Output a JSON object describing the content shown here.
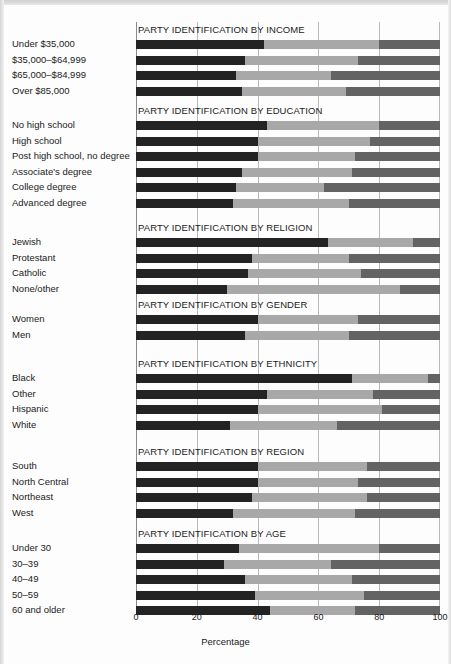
{
  "figure": {
    "xlabel": "Percentage",
    "xticks": [
      "0",
      "20",
      "40",
      "60",
      "80",
      "100"
    ]
  },
  "chart_data": {
    "type": "bar",
    "subtype": "stacked-horizontal-100pct",
    "title": "",
    "xlabel": "Percentage",
    "ylabel": "",
    "xlim": [
      0,
      100
    ],
    "xticks": [
      0,
      20,
      40,
      60,
      80,
      100
    ],
    "grid": true,
    "legend_position": "none",
    "series": [
      {
        "name": "Democrat",
        "color": "#232323"
      },
      {
        "name": "Independent",
        "color": "#a8a8a8"
      },
      {
        "name": "Republican",
        "color": "#636363"
      }
    ],
    "panels": [
      {
        "title": "PARTY IDENTIFICATION BY INCOME",
        "categories": [
          "Under $35,000",
          "$35,000–$64,999",
          "$65,000–$84,999",
          "Over $85,000"
        ],
        "values": [
          [
            42,
            38,
            20
          ],
          [
            36,
            37,
            27
          ],
          [
            33,
            31,
            36
          ],
          [
            35,
            34,
            31
          ]
        ]
      },
      {
        "title": "PARTY IDENTIFICATION BY EDUCATION",
        "categories": [
          "No high school",
          "High school",
          "Post high school, no degree",
          "Associate's degree",
          "College degree",
          "Advanced degree"
        ],
        "values": [
          [
            43,
            37,
            20
          ],
          [
            40,
            37,
            23
          ],
          [
            40,
            32,
            28
          ],
          [
            35,
            36,
            29
          ],
          [
            33,
            29,
            38
          ],
          [
            32,
            38,
            30
          ]
        ]
      },
      {
        "title": "PARTY IDENTIFICATION BY RELIGION",
        "categories": [
          "Jewish",
          "Protestant",
          "Catholic",
          "None/other"
        ],
        "values": [
          [
            63,
            28,
            9
          ],
          [
            38,
            32,
            30
          ],
          [
            37,
            37,
            26
          ],
          [
            30,
            57,
            13
          ]
        ]
      },
      {
        "title": "PARTY IDENTIFICATION BY GENDER",
        "categories": [
          "Women",
          "Men"
        ],
        "values": [
          [
            40,
            33,
            27
          ],
          [
            36,
            34,
            30
          ]
        ]
      },
      {
        "title": "PARTY IDENTIFICATION BY ETHNICITY",
        "categories": [
          "Black",
          "Other",
          "Hispanic",
          "White"
        ],
        "values": [
          [
            71,
            25,
            4
          ],
          [
            43,
            35,
            22
          ],
          [
            40,
            41,
            19
          ],
          [
            31,
            35,
            34
          ]
        ]
      },
      {
        "title": "PARTY IDENTIFICATION BY REGION",
        "categories": [
          "South",
          "North Central",
          "Northeast",
          "West"
        ],
        "values": [
          [
            40,
            36,
            24
          ],
          [
            40,
            33,
            27
          ],
          [
            38,
            38,
            24
          ],
          [
            32,
            40,
            28
          ]
        ]
      },
      {
        "title": "PARTY IDENTIFICATION BY AGE",
        "categories": [
          "Under 30",
          "30–39",
          "40–49",
          "50–59",
          "60 and older"
        ],
        "values": [
          [
            34,
            46,
            20
          ],
          [
            29,
            35,
            36
          ],
          [
            36,
            35,
            29
          ],
          [
            39,
            36,
            25
          ],
          [
            44,
            28,
            28
          ]
        ]
      }
    ]
  }
}
